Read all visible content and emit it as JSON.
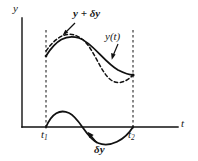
{
  "figure": {
    "type": "variational-calculus-diagram",
    "background_color": "#ffffff",
    "line_color": "#111111",
    "axes": {
      "y_label": "y",
      "t_label": "t",
      "y_axis_x": 22,
      "t_axis_y": 127,
      "y_axis_top": 18,
      "t_axis_right": 178
    },
    "labels": {
      "varied_curve": "y + δy",
      "base_curve": "y(t)",
      "variation": "δy",
      "t1": "t",
      "t1_sub": "1",
      "t2": "t",
      "t2_sub": "2"
    },
    "markers": {
      "t1_x": 46,
      "t2_x": 133,
      "dashed_vertical_top": 30,
      "dashed_vertical_bottom": 127
    },
    "curves": {
      "y_of_t": {
        "style": "solid",
        "path": "M46,56 C56,40 66,34 79,38 C92,42 104,62 118,70 C126,74 130,75 133,75"
      },
      "y_plus_delta_y": {
        "style": "dashed",
        "path": "M46,51 C58,34 70,30 82,39 C94,48 100,72 111,80 C120,86 128,80 133,75"
      },
      "delta_y": {
        "style": "solid",
        "path": "M46,127 C52,113 60,109 69,113 C80,118 86,138 98,143 C110,148 125,140 133,127"
      }
    },
    "arrows": {
      "to_varied_curve": {
        "from_x": 75,
        "from_y": 23,
        "to_x": 63,
        "to_y": 35
      },
      "to_base_curve": {
        "from_x": 120,
        "from_y": 44,
        "to_x": 112,
        "to_y": 59
      },
      "to_variation": {
        "from_x": 97,
        "from_y": 143,
        "to_x": 88,
        "to_y": 132
      }
    }
  }
}
